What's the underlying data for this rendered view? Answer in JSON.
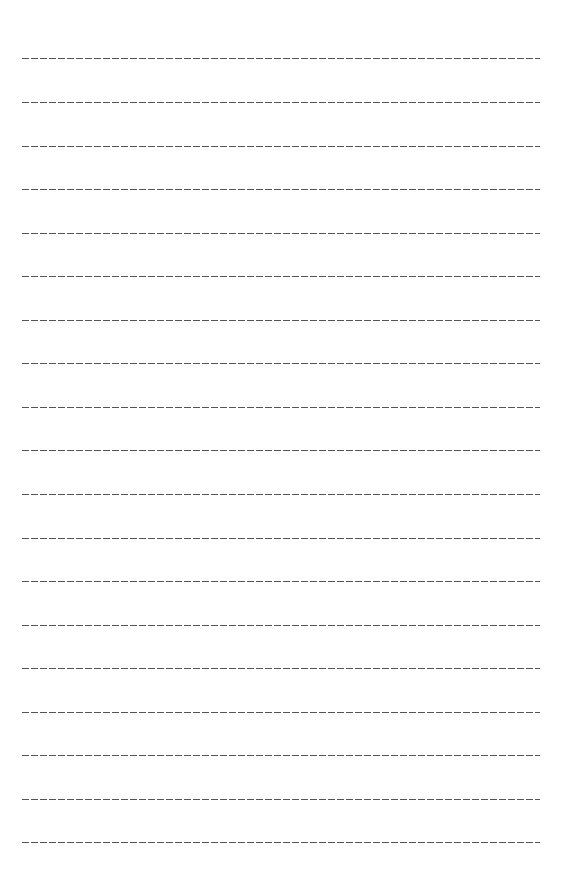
{
  "page": {
    "type": "lined-writing-sheet",
    "line_style": "dashed",
    "line_color": "#555555",
    "line_count": 19,
    "line_positions_y": [
      58,
      102,
      146,
      189,
      233,
      276,
      320,
      363,
      407,
      450,
      494,
      538,
      581,
      625,
      668,
      712,
      755,
      799,
      842
    ]
  }
}
